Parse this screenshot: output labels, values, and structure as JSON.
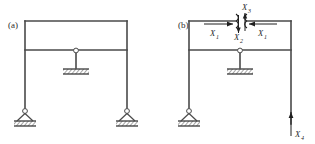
{
  "figure": {
    "type": "structural-frame-diagram",
    "background_color": "#ffffff",
    "line_color": "#4a4a4a",
    "label_color": "#1f1f1f"
  },
  "panels": [
    {
      "id": "a",
      "label": "(a)",
      "label_x": 8,
      "label_y": 28,
      "supports": [
        {
          "name": "pin-support-left",
          "type": "pinned",
          "x": 25,
          "y": 112
        },
        {
          "name": "pin-support-center",
          "type": "pinned-hatched",
          "x": 76,
          "y": 72
        },
        {
          "name": "pin-support-right",
          "type": "pinned",
          "x": 127,
          "y": 112
        }
      ],
      "members": {
        "top_beam_y": 21,
        "second_beam_y": 50,
        "left_column_x": 25,
        "right_column_x": 127,
        "center_column_x": 76
      }
    },
    {
      "id": "b",
      "label": "(b)",
      "label_x": 178,
      "label_y": 28,
      "supports": [
        {
          "name": "pin-support-left",
          "type": "pinned",
          "x": 189,
          "y": 112
        },
        {
          "name": "pin-support-center",
          "type": "pinned-hatched",
          "x": 240,
          "y": 72
        }
      ],
      "members": {
        "top_beam_y": 21,
        "second_beam_y": 50,
        "left_column_x": 189,
        "right_column_x": 291,
        "center_column_x": 240,
        "right_column_bottom_y": 124
      },
      "cut": {
        "name": "beam-cut",
        "x": 240,
        "y": 21
      }
    }
  ],
  "force_labels": [
    {
      "name": "force-label-x3",
      "base": "X",
      "sub": "3",
      "x": 242,
      "y": 10,
      "panel": "b"
    },
    {
      "name": "force-label-x1-left",
      "base": "X",
      "sub": "1",
      "x": 213,
      "y": 36,
      "panel": "b"
    },
    {
      "name": "force-label-x2",
      "base": "X",
      "sub": "2",
      "x": 240,
      "y": 39,
      "panel": "b"
    },
    {
      "name": "force-label-x1-right",
      "base": "X",
      "sub": "1",
      "x": 262,
      "y": 36,
      "panel": "b"
    },
    {
      "name": "force-label-x4",
      "base": "X",
      "sub": "4",
      "x": 296,
      "y": 137,
      "panel": "b"
    }
  ],
  "arrows": [
    {
      "name": "arrow-x1-left",
      "direction": "right",
      "from_x": 204,
      "to_x": 233,
      "y": 24
    },
    {
      "name": "arrow-x1-right",
      "direction": "left",
      "from_x": 277,
      "to_x": 248,
      "y": 24
    },
    {
      "name": "arrow-x2-down",
      "direction": "down",
      "x": 238,
      "from_y": 16,
      "to_y": 33
    },
    {
      "name": "arrow-x3-up",
      "direction": "up",
      "x": 245,
      "from_y": 30,
      "to_y": 13
    },
    {
      "name": "arrow-x4-up",
      "direction": "up",
      "x": 291,
      "from_y": 134,
      "to_y": 112
    }
  ]
}
